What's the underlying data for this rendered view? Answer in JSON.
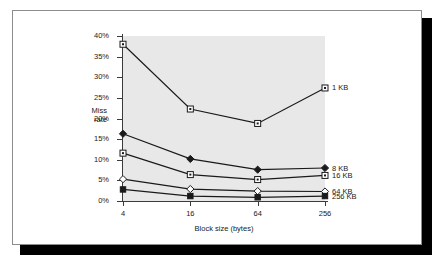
{
  "chart_data": {
    "type": "line",
    "title": "",
    "xlabel": "Block size (bytes)",
    "ylabel": "Miss rate",
    "ylabel_lines": [
      "Miss",
      "rate"
    ],
    "categories": [
      "4",
      "16",
      "64",
      "256"
    ],
    "x_tick_labels": [
      "4",
      "16",
      "64",
      "256"
    ],
    "y_tick_labels": [
      "0%",
      "5%",
      "10%",
      "15%",
      "20%",
      "25%",
      "30%",
      "35%",
      "40%"
    ],
    "y_tick_values": [
      0,
      5,
      10,
      15,
      20,
      25,
      30,
      35,
      40
    ],
    "ylim": [
      0,
      40
    ],
    "grid": false,
    "legend_position": "right-inline",
    "plot_background": "#e8e8e8",
    "series": [
      {
        "name": "1 KB",
        "marker": "open-square-dot",
        "values": [
          38.0,
          22.3,
          18.8,
          27.4
        ],
        "label_y_percent": 27.4
      },
      {
        "name": "8 KB",
        "marker": "filled-diamond",
        "values": [
          16.3,
          10.2,
          7.6,
          8.0
        ],
        "label_y_percent": 8.0
      },
      {
        "name": "16 KB",
        "marker": "open-square-dot",
        "values": [
          11.6,
          6.4,
          5.2,
          6.2
        ],
        "label_y_percent": 6.2
      },
      {
        "name": "64 KB",
        "marker": "open-diamond",
        "values": [
          5.3,
          2.9,
          2.4,
          2.3
        ],
        "label_y_percent": 2.3
      },
      {
        "name": "256 KB",
        "marker": "filled-square",
        "values": [
          2.8,
          1.2,
          0.9,
          1.2
        ],
        "label_y_percent": 1.2
      }
    ]
  },
  "legend": {
    "items": [
      {
        "label": "1 KB"
      },
      {
        "label": "8 KB"
      },
      {
        "label": "16 KB"
      },
      {
        "label": "64 KB"
      },
      {
        "label": "256 KB"
      }
    ]
  },
  "axes": {
    "y_ticks": [
      {
        "label": "0%"
      },
      {
        "label": "5%"
      },
      {
        "label": "10%"
      },
      {
        "label": "15%"
      },
      {
        "label": "20%"
      },
      {
        "label": "25%"
      },
      {
        "label": "30%"
      },
      {
        "label": "35%"
      },
      {
        "label": "40%"
      }
    ],
    "x_ticks": [
      {
        "label": "4"
      },
      {
        "label": "16"
      },
      {
        "label": "64"
      },
      {
        "label": "256"
      }
    ],
    "y_title_line1": "Miss",
    "y_title_line2": "rate",
    "x_title": "Block size (bytes)"
  },
  "colors": {
    "plot_fill": "#e8e8e8",
    "axis": "#3b3b3b",
    "line": "#1a1a1a",
    "text": "#1a1a1a",
    "frame": "#8d8d8d",
    "shadow": "#000000"
  }
}
